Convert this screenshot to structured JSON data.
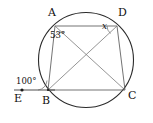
{
  "figure": {
    "type": "geometry-diagram",
    "colors": {
      "circle": "#2b2b2b",
      "sides": "#5a5a5a",
      "diagonals": "#7a7a7a",
      "ray": "#3a3a3a",
      "text": "#111111",
      "background": "#ffffff"
    }
  },
  "vertices": [
    {
      "name": "A",
      "label": "A",
      "x": 55,
      "y": 26,
      "label_x": 48,
      "label_y": 8
    },
    {
      "name": "D",
      "label": "D",
      "x": 117,
      "y": 26,
      "label_x": 119,
      "label_y": 8
    },
    {
      "name": "B",
      "label": "B",
      "x": 48,
      "y": 90,
      "label_x": 43,
      "label_y": 96
    },
    {
      "name": "C",
      "label": "C",
      "x": 125,
      "y": 90,
      "label_x": 128,
      "label_y": 92
    },
    {
      "name": "E",
      "label": "E",
      "x": 22,
      "y": 90,
      "label_x": 15,
      "label_y": 94
    }
  ],
  "circle": {
    "center_x": 86,
    "center_y": 60,
    "radius": 48
  },
  "segments": [
    {
      "name": "side-AD",
      "from": "A",
      "to": "D"
    },
    {
      "name": "side-AB",
      "from": "A",
      "to": "B"
    },
    {
      "name": "side-DC",
      "from": "D",
      "to": "C"
    },
    {
      "name": "side-BC",
      "from": "B",
      "to": "C"
    },
    {
      "name": "diagonal-AC",
      "from": "A",
      "to": "C"
    },
    {
      "name": "diagonal-BD",
      "from": "B",
      "to": "D"
    },
    {
      "name": "ray-EB",
      "from": "E",
      "to": "B"
    }
  ],
  "angles": [
    {
      "name": "angle-at-A",
      "label": "53°",
      "value": 53,
      "unit": "degrees",
      "at_vertex": "A",
      "label_x": 50,
      "label_y": 32
    },
    {
      "name": "angle-at-D-unknown",
      "label": "x",
      "value": null,
      "unit": "degrees",
      "at_vertex": "D",
      "label_x": 102,
      "label_y": 23
    },
    {
      "name": "exterior-angle-at-B",
      "label": "100°",
      "value": 100,
      "unit": "degrees",
      "at_vertex": "B",
      "label_x": 17,
      "label_y": 78
    }
  ]
}
